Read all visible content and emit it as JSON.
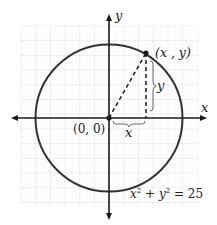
{
  "diagram": {
    "type": "circle-on-coordinate-plane",
    "axes": {
      "x_label": "x",
      "y_label": "y"
    },
    "origin_label": "(0, 0)",
    "point_label": "(x , y)",
    "horizontal_leg_label": "x",
    "vertical_leg_label": "y",
    "equation": {
      "x": "x",
      "x_exp": "2",
      "plus": " + ",
      "y": "y",
      "y_exp": "2",
      "equals": " = 25"
    },
    "radius": 5,
    "colors": {
      "circle": "#333333",
      "axes": "#1a1a1a",
      "grid_major": "#bdbdbd",
      "grid_minor": "#dedede"
    }
  }
}
